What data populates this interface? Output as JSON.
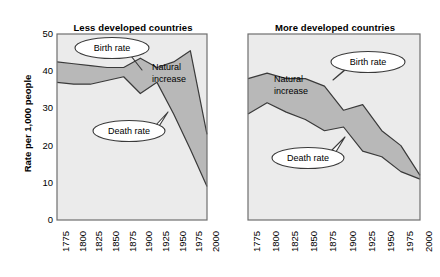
{
  "figure": {
    "ylabel": "Rate per 1,000 people",
    "panels": [
      {
        "key": "less",
        "title": "Less developed countries"
      },
      {
        "key": "more",
        "title": "More developed countries"
      }
    ],
    "annotations": {
      "birth_rate": "Birth rate",
      "death_rate": "Death rate",
      "natural_increase_line1": "Natural",
      "natural_increase_line2": "increase"
    },
    "colors": {
      "plot_background": "#ebebeb",
      "band_fill": "#b8b8b8",
      "line": "#3a3a3a",
      "frame": "#6e6e6e",
      "text": "#000000",
      "callout_fill": "#ffffff"
    }
  },
  "chart_data": {
    "type": "area",
    "xlabel": "",
    "ylabel": "Rate per 1,000 people",
    "ylim": [
      0,
      50
    ],
    "yticks": [
      0,
      10,
      20,
      30,
      40,
      50
    ],
    "xlim": [
      1775,
      2000
    ],
    "xticks": [
      1775,
      1800,
      1825,
      1850,
      1875,
      1900,
      1925,
      1950,
      1975,
      2000
    ],
    "xtick_labels": [
      "1775",
      "1800",
      "1825",
      "1850",
      "1875",
      "1900",
      "1925",
      "1950",
      "1975",
      "2000"
    ],
    "grid": false,
    "legend_position": "inline-callouts",
    "panels": [
      {
        "name": "Less developed countries",
        "x": [
          1775,
          1800,
          1825,
          1850,
          1875,
          1900,
          1925,
          1950,
          1975,
          2000
        ],
        "series": [
          {
            "name": "Birth rate",
            "values": [
              42.5,
              42.0,
              41.5,
              41.0,
              41.0,
              43.5,
              41.0,
              42.5,
              45.5,
              23.0
            ]
          },
          {
            "name": "Death rate",
            "values": [
              37.0,
              36.5,
              36.5,
              37.5,
              38.5,
              34.0,
              37.0,
              28.5,
              19.0,
              9.0
            ]
          }
        ],
        "band": {
          "name": "Natural increase",
          "between": [
            "Birth rate",
            "Death rate"
          ]
        }
      },
      {
        "name": "More developed countries",
        "x": [
          1775,
          1800,
          1825,
          1850,
          1875,
          1900,
          1925,
          1950,
          1975,
          2000
        ],
        "series": [
          {
            "name": "Birth rate",
            "values": [
              38.0,
              39.5,
              38.0,
              38.0,
              36.0,
              29.5,
              31.0,
              24.0,
              20.0,
              12.0
            ]
          },
          {
            "name": "Death rate",
            "values": [
              28.5,
              31.5,
              29.0,
              27.0,
              24.0,
              25.0,
              18.5,
              17.0,
              13.0,
              11.0
            ]
          }
        ],
        "band": {
          "name": "Natural increase",
          "between": [
            "Birth rate",
            "Death rate"
          ]
        }
      }
    ]
  }
}
